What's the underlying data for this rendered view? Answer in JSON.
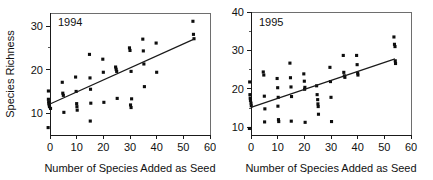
{
  "figure": {
    "background": "#ffffff",
    "point_color": "#0d0d0d",
    "axis_color": "#1a1a1a",
    "frame_color": "#6e6e6e"
  },
  "chart_data": [
    {
      "type": "scatter",
      "title": "1994",
      "panel_label": "1994",
      "xlabel": "Number of Species Added as Seed",
      "ylabel": "Species Richness",
      "xlim": [
        0,
        60
      ],
      "ylim": [
        5,
        33
      ],
      "xticks": [
        0,
        10,
        20,
        30,
        40,
        50,
        60
      ],
      "xticklabels": [
        "0",
        "10",
        "20",
        "30",
        "40",
        "50",
        "60"
      ],
      "yticks": [
        10,
        20,
        30
      ],
      "yticklabels": [
        "10",
        "20",
        "30"
      ],
      "yminorticks": [
        15,
        25
      ],
      "grid": false,
      "legend": "none",
      "marker": "square",
      "points": [
        {
          "x": -0.6,
          "y": 15.1
        },
        {
          "x": -0.6,
          "y": 13.2
        },
        {
          "x": -0.5,
          "y": 12.6
        },
        {
          "x": -0.4,
          "y": 12.2
        },
        {
          "x": -0.3,
          "y": 11.9
        },
        {
          "x": -0.2,
          "y": 11.5
        },
        {
          "x": 0.2,
          "y": 11.1
        },
        {
          "x": -0.7,
          "y": 6.7
        },
        {
          "x": 4.6,
          "y": 17.1
        },
        {
          "x": 4.8,
          "y": 14.6
        },
        {
          "x": 5.0,
          "y": 14.1
        },
        {
          "x": 5.2,
          "y": 10.2
        },
        {
          "x": 9.6,
          "y": 18.3
        },
        {
          "x": 9.8,
          "y": 15.0
        },
        {
          "x": 10.0,
          "y": 12.2
        },
        {
          "x": 10.1,
          "y": 11.5
        },
        {
          "x": 10.2,
          "y": 10.7
        },
        {
          "x": 14.8,
          "y": 23.5
        },
        {
          "x": 15.0,
          "y": 18.1
        },
        {
          "x": 15.2,
          "y": 15.5
        },
        {
          "x": 15.3,
          "y": 12.3
        },
        {
          "x": 15.1,
          "y": 8.2
        },
        {
          "x": 19.8,
          "y": 22.4
        },
        {
          "x": 20.0,
          "y": 19.4
        },
        {
          "x": 20.2,
          "y": 12.5
        },
        {
          "x": 24.6,
          "y": 20.6
        },
        {
          "x": 24.8,
          "y": 20.1
        },
        {
          "x": 25.0,
          "y": 19.6
        },
        {
          "x": 25.2,
          "y": 13.4
        },
        {
          "x": 29.8,
          "y": 25.0
        },
        {
          "x": 30.0,
          "y": 24.4
        },
        {
          "x": 30.4,
          "y": 19.6
        },
        {
          "x": 30.6,
          "y": 13.3
        },
        {
          "x": 30.2,
          "y": 11.9
        },
        {
          "x": 30.4,
          "y": 11.3
        },
        {
          "x": 34.8,
          "y": 27.0
        },
        {
          "x": 35.0,
          "y": 24.3
        },
        {
          "x": 35.2,
          "y": 21.3
        },
        {
          "x": 35.4,
          "y": 16.1
        },
        {
          "x": 39.8,
          "y": 26.1
        },
        {
          "x": 40.0,
          "y": 19.4
        },
        {
          "x": 53.6,
          "y": 31.1
        },
        {
          "x": 53.8,
          "y": 28.1
        },
        {
          "x": 54.0,
          "y": 27.1
        }
      ],
      "fit_line": {
        "x0": 0,
        "y0": 12.1,
        "x1": 54,
        "y1": 27.0
      }
    },
    {
      "type": "scatter",
      "title": "1995",
      "panel_label": "1995",
      "xlabel": "Number of Species Added as Seed",
      "ylabel": "",
      "xlim": [
        0,
        60
      ],
      "ylim": [
        8,
        40
      ],
      "xticks": [
        0,
        10,
        20,
        30,
        40,
        50,
        60
      ],
      "xticklabels": [
        "0",
        "10",
        "20",
        "30",
        "40",
        "50",
        "60"
      ],
      "yticks": [
        10,
        20,
        30,
        40
      ],
      "yticklabels": [
        "10",
        "20",
        "30",
        "40"
      ],
      "yminorticks": [
        15,
        25,
        35
      ],
      "grid": false,
      "legend": "none",
      "marker": "square",
      "points": [
        {
          "x": -0.5,
          "y": 21.8
        },
        {
          "x": -0.4,
          "y": 18.5
        },
        {
          "x": -0.3,
          "y": 17.6
        },
        {
          "x": -0.2,
          "y": 17.0
        },
        {
          "x": 0.0,
          "y": 16.3
        },
        {
          "x": 0.1,
          "y": 15.6
        },
        {
          "x": -0.6,
          "y": 9.7
        },
        {
          "x": 4.6,
          "y": 24.4
        },
        {
          "x": 4.8,
          "y": 23.6
        },
        {
          "x": 5.0,
          "y": 18.1
        },
        {
          "x": 5.2,
          "y": 14.8
        },
        {
          "x": 5.1,
          "y": 11.4
        },
        {
          "x": 9.8,
          "y": 22.7
        },
        {
          "x": 10.0,
          "y": 20.3
        },
        {
          "x": 10.2,
          "y": 17.8
        },
        {
          "x": 10.1,
          "y": 15.5
        },
        {
          "x": 10.3,
          "y": 12.0
        },
        {
          "x": 10.4,
          "y": 11.5
        },
        {
          "x": 14.6,
          "y": 26.7
        },
        {
          "x": 14.8,
          "y": 22.9
        },
        {
          "x": 15.0,
          "y": 20.5
        },
        {
          "x": 15.2,
          "y": 18.0
        },
        {
          "x": 15.1,
          "y": 11.6
        },
        {
          "x": 19.8,
          "y": 23.9
        },
        {
          "x": 20.0,
          "y": 22.0
        },
        {
          "x": 20.2,
          "y": 20.4
        },
        {
          "x": 20.1,
          "y": 19.9
        },
        {
          "x": 20.3,
          "y": 11.3
        },
        {
          "x": 24.6,
          "y": 20.8
        },
        {
          "x": 24.8,
          "y": 18.5
        },
        {
          "x": 25.0,
          "y": 17.2
        },
        {
          "x": 25.1,
          "y": 16.1
        },
        {
          "x": 25.2,
          "y": 15.4
        },
        {
          "x": 25.3,
          "y": 13.4
        },
        {
          "x": 29.6,
          "y": 25.6
        },
        {
          "x": 29.8,
          "y": 21.9
        },
        {
          "x": 30.0,
          "y": 17.8
        },
        {
          "x": 30.2,
          "y": 11.5
        },
        {
          "x": 34.6,
          "y": 28.7
        },
        {
          "x": 34.8,
          "y": 24.3
        },
        {
          "x": 35.0,
          "y": 23.4
        },
        {
          "x": 35.2,
          "y": 23.0
        },
        {
          "x": 39.6,
          "y": 28.7
        },
        {
          "x": 39.8,
          "y": 26.3
        },
        {
          "x": 40.0,
          "y": 24.1
        },
        {
          "x": 40.1,
          "y": 23.6
        },
        {
          "x": 53.6,
          "y": 33.5
        },
        {
          "x": 53.8,
          "y": 31.6
        },
        {
          "x": 54.0,
          "y": 31.0
        },
        {
          "x": 54.1,
          "y": 27.3
        },
        {
          "x": 54.2,
          "y": 26.6
        }
      ],
      "fit_line": {
        "x0": 0,
        "y0": 15.2,
        "x1": 54,
        "y1": 27.8
      }
    }
  ]
}
